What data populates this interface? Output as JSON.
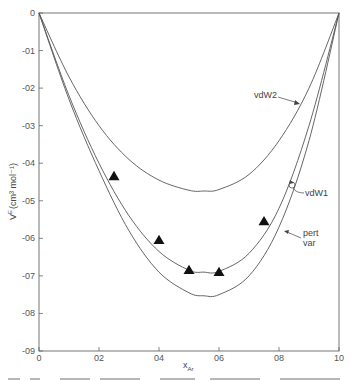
{
  "chart_data": {
    "type": "line",
    "title": "",
    "xlabel": "x_Ar",
    "ylabel": "V^E (cm^3 mol^-1)",
    "xlim": [
      0,
      1.0
    ],
    "ylim": [
      -0.9,
      0
    ],
    "grid": false,
    "x_ticks": [
      "0",
      "0.2",
      "0.4",
      "0.6",
      "0.8",
      "1.0"
    ],
    "x_tick_labels": [
      "0",
      "02",
      "04",
      "06",
      "08",
      "10"
    ],
    "y_ticks": [
      0,
      -0.1,
      -0.2,
      -0.3,
      -0.4,
      -0.5,
      -0.6,
      -0.7,
      -0.8,
      -0.9
    ],
    "y_tick_labels": [
      "0",
      "-01",
      "-02",
      "-03",
      "-04",
      "-05",
      "-06",
      "-07",
      "-08",
      "-09"
    ],
    "series": [
      {
        "name": "vdW2",
        "x": [
          0,
          0.1,
          0.2,
          0.3,
          0.4,
          0.5,
          0.55,
          0.6,
          0.7,
          0.8,
          0.9,
          1.0
        ],
        "values": [
          0,
          -0.17,
          -0.3,
          -0.39,
          -0.445,
          -0.472,
          -0.474,
          -0.47,
          -0.43,
          -0.34,
          -0.2,
          0
        ]
      },
      {
        "name": "vdW1",
        "x": [
          0,
          0.1,
          0.2,
          0.3,
          0.4,
          0.5,
          0.55,
          0.6,
          0.7,
          0.8,
          0.9,
          1.0
        ],
        "values": [
          0,
          -0.22,
          -0.4,
          -0.54,
          -0.635,
          -0.685,
          -0.69,
          -0.688,
          -0.64,
          -0.52,
          -0.3,
          0
        ]
      },
      {
        "name": "pert var",
        "x": [
          0,
          0.1,
          0.2,
          0.3,
          0.4,
          0.5,
          0.55,
          0.6,
          0.7,
          0.8,
          0.9,
          1.0
        ],
        "values": [
          0,
          -0.23,
          -0.42,
          -0.58,
          -0.69,
          -0.745,
          -0.753,
          -0.75,
          -0.7,
          -0.57,
          -0.34,
          0
        ]
      }
    ],
    "markers": {
      "name": "experimental",
      "shape": "triangle",
      "x": [
        0.25,
        0.4,
        0.5,
        0.6,
        0.75
      ],
      "values": [
        -0.435,
        -0.605,
        -0.685,
        -0.69,
        -0.555
      ]
    },
    "annotations": [
      {
        "text": "vdW2",
        "target": "vdW2"
      },
      {
        "text": "vdW1",
        "target": "vdW1"
      },
      {
        "text": "pert",
        "line2": "var",
        "target": "pert var"
      }
    ]
  },
  "labels": {
    "vdW2": "vdW2",
    "vdW1": "vdW1",
    "pert": "pert",
    "var": "var",
    "ylabel_main": "V",
    "ylabel_sup": "E",
    "ylabel_unit": "(cm³ mol⁻¹)",
    "xlabel_main": "x",
    "xlabel_sub": "Ar"
  }
}
